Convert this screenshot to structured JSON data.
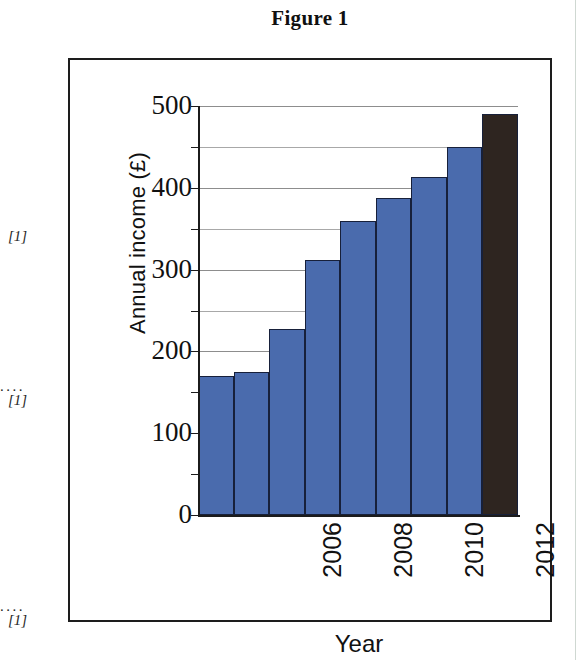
{
  "figure": {
    "title": "Figure 1"
  },
  "margin_annotations": [
    {
      "leader": "",
      "mark": "[1]"
    },
    {
      "leader": "....",
      "mark": "[1]"
    },
    {
      "leader": "....",
      "mark": "[1]"
    }
  ],
  "colors": {
    "bar_blue": "#4a6bad",
    "bar_highlight": "#2e2520",
    "bar_outline": "#17203a",
    "gridline": "#8d8d8d",
    "axis": "#1b1b1b",
    "text": "#111111",
    "figure_border": "#1d1d1d"
  },
  "chart_data": {
    "type": "bar",
    "title": "Figure 1",
    "xlabel": "Year",
    "ylabel": "Annual income (£)",
    "categories": [
      "2006",
      "2007",
      "2008",
      "2009",
      "2010",
      "2011",
      "2012",
      "2013",
      "2014"
    ],
    "visible_tick_labels": [
      "2006",
      "2008",
      "2010",
      "2012",
      "2014"
    ],
    "values": [
      170,
      175,
      227,
      312,
      360,
      387,
      413,
      450,
      490
    ],
    "bar_colors": [
      "#4a6bad",
      "#4a6bad",
      "#4a6bad",
      "#4a6bad",
      "#4a6bad",
      "#4a6bad",
      "#4a6bad",
      "#4a6bad",
      "#2e2520"
    ],
    "ylim": [
      0,
      500
    ],
    "y_major_ticks": [
      0,
      100,
      200,
      300,
      400,
      500
    ],
    "y_minor_ticks": [
      50,
      150,
      250,
      350,
      450
    ],
    "y_tick_labels": [
      "0",
      "100",
      "200",
      "300",
      "400",
      "500"
    ],
    "grid": true,
    "grid_axis": "y",
    "legend": false,
    "xlabel_rotation": 90
  }
}
